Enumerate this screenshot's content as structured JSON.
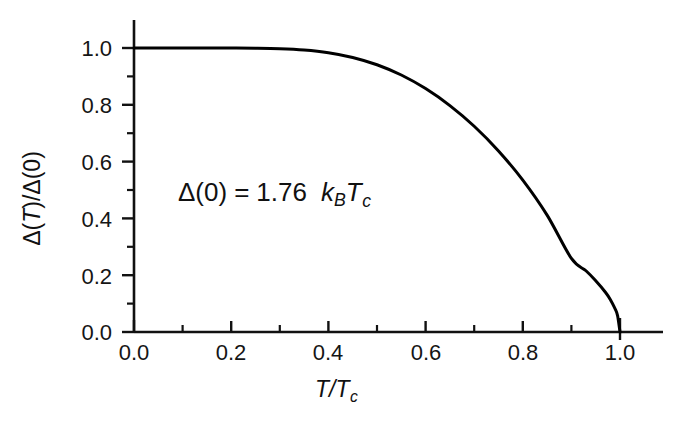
{
  "chart_data": {
    "type": "line",
    "title": "",
    "subtitle": "",
    "xlabel": "T/T_c",
    "ylabel": "Δ(T)/Δ(0)",
    "xlim": [
      0.0,
      1.06
    ],
    "ylim": [
      0.0,
      1.06
    ],
    "grid": false,
    "legend": null,
    "legend_position": "none",
    "line_color": "#000000",
    "line_width": 3,
    "xticks": [
      0.0,
      0.2,
      0.4,
      0.6,
      0.8,
      1.0
    ],
    "xtick_labels": [
      "0.0",
      "0.2",
      "0.4",
      "0.6",
      "0.8",
      "1.0"
    ],
    "x_minor_ticks": [
      0.1,
      0.3,
      0.5,
      0.7,
      0.9
    ],
    "yticks": [
      0.0,
      0.2,
      0.4,
      0.6,
      0.8,
      1.0
    ],
    "ytick_labels": [
      "0.0",
      "0.2",
      "0.4",
      "0.6",
      "0.8",
      "1.0"
    ],
    "y_minor_ticks": [
      0.1,
      0.3,
      0.5,
      0.7,
      0.9
    ],
    "series": [
      {
        "name": "BCS gap",
        "x": [
          0.0,
          0.05,
          0.1,
          0.15,
          0.2,
          0.25,
          0.3,
          0.35,
          0.4,
          0.45,
          0.5,
          0.55,
          0.6,
          0.65,
          0.7,
          0.75,
          0.8,
          0.85,
          0.9,
          0.93,
          0.95,
          0.97,
          0.98,
          0.99,
          0.995,
          1.0
        ],
        "y": [
          1.0,
          1.0,
          1.0,
          1.0,
          0.9999,
          0.9994,
          0.9977,
          0.9931,
          0.9835,
          0.9668,
          0.9411,
          0.9049,
          0.8571,
          0.7972,
          0.7244,
          0.6376,
          0.5347,
          0.4114,
          0.2589,
          0.2156,
          0.1802,
          0.1401,
          0.1146,
          0.0812,
          0.0575,
          0.0
        ]
      }
    ],
    "annotations": [
      {
        "name": "gap-ratio-annotation",
        "text": "Δ(0) = 1.76 k_B T_c",
        "delta": "Δ(0)",
        "equals": "=",
        "value": "1.76",
        "k_symbol": "k",
        "k_subscript": "B",
        "t_symbol": "T",
        "t_subscript": "c",
        "x": 0.32,
        "y": 0.5
      }
    ]
  },
  "axis": {
    "x_title_numerator": "T",
    "x_title_slash": "/",
    "x_title_denominator": "T",
    "x_title_subscript": "c",
    "y_title": "Δ(T)/Δ(0)",
    "y_title_delta1": "Δ(",
    "y_title_var1": "T",
    "y_title_mid": ")/Δ(0)"
  }
}
